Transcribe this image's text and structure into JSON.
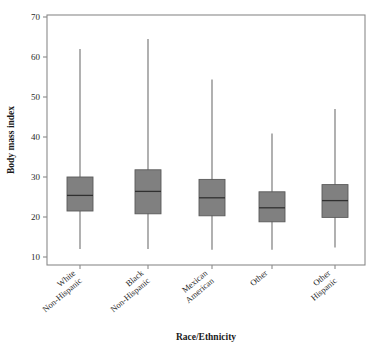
{
  "chart_data": {
    "type": "box",
    "title": "",
    "xlabel": "Race/Ethnicity",
    "ylabel": "Body mass index",
    "ylim": [
      10,
      70
    ],
    "yticks": [
      10,
      20,
      30,
      40,
      50,
      60,
      70
    ],
    "ytick_labels": [
      "10",
      "20",
      "30",
      "40",
      "50",
      "60",
      "70"
    ],
    "grid": false,
    "legend": "none",
    "categories": [
      "White\nNon-Hispanic",
      "Black\nNon-Hispanic",
      "Mexican\nAmerican",
      "Other",
      "Other\nHispanic"
    ],
    "category_lines": [
      [
        "White",
        "Non-Hispanic"
      ],
      [
        "Black",
        "Non-Hispanic"
      ],
      [
        "Mexican",
        "American"
      ],
      [
        "Other",
        ""
      ],
      [
        "Other",
        "Hispanic"
      ]
    ],
    "boxes": [
      {
        "category": "White Non-Hispanic",
        "whisker_low": 12.0,
        "q1": 21.5,
        "median": 25.4,
        "q3": 30.0,
        "whisker_high": 62.0
      },
      {
        "category": "Black Non-Hispanic",
        "whisker_low": 12.0,
        "q1": 20.8,
        "median": 26.4,
        "q3": 31.8,
        "whisker_high": 64.5
      },
      {
        "category": "Mexican American",
        "whisker_low": 11.8,
        "q1": 20.3,
        "median": 24.8,
        "q3": 29.4,
        "whisker_high": 54.4
      },
      {
        "category": "Other",
        "whisker_low": 11.8,
        "q1": 18.8,
        "median": 22.3,
        "q3": 26.3,
        "whisker_high": 40.9
      },
      {
        "category": "Other Hispanic",
        "whisker_low": 12.4,
        "q1": 19.9,
        "median": 24.1,
        "q3": 28.1,
        "whisker_high": 47.0
      }
    ],
    "colors": {
      "box_fill": "#808080",
      "box_edge": "#5a5a5a",
      "median_line": "#303030",
      "whisker": "#707070",
      "frame": "#8a8a8a",
      "text": "#2a2a2a",
      "background": "#ffffff"
    }
  }
}
